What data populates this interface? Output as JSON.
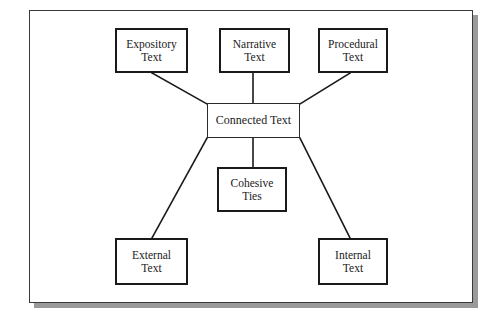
{
  "diagram": {
    "frame": {
      "border_color": "#3a3a3a",
      "background_color": "#ffffff",
      "shadow_color": "#9a9a9a"
    },
    "nodes": [
      {
        "id": "expository-text",
        "label": "Expository\nText",
        "x": 115,
        "y": 28,
        "w": 73,
        "h": 45,
        "font_size": 11.5
      },
      {
        "id": "narrative-text",
        "label": "Narrative\nText",
        "x": 219,
        "y": 28,
        "w": 71,
        "h": 45,
        "font_size": 11.5
      },
      {
        "id": "procedural-text",
        "label": "Procedural\nText",
        "x": 318,
        "y": 28,
        "w": 70,
        "h": 45,
        "font_size": 11.5
      },
      {
        "id": "connected-text",
        "label": "Connected Text",
        "x": 207,
        "y": 103,
        "w": 93,
        "h": 35,
        "font_size": 12
      },
      {
        "id": "cohesive-ties",
        "label": "Cohesive\nTies",
        "x": 217,
        "y": 167,
        "w": 70,
        "h": 45,
        "font_size": 11.5
      },
      {
        "id": "external-text",
        "label": "External\nText",
        "x": 115,
        "y": 238,
        "w": 73,
        "h": 47,
        "font_size": 11.5
      },
      {
        "id": "internal-text",
        "label": "Internal\nText",
        "x": 318,
        "y": 238,
        "w": 70,
        "h": 47,
        "font_size": 11.5
      }
    ],
    "edges": [
      {
        "id": "edge-expository-connected",
        "from": "expository-text",
        "to": "connected-text",
        "x1": 152,
        "y1": 73,
        "x2": 207,
        "y2": 104
      },
      {
        "id": "edge-narrative-connected",
        "from": "narrative-text",
        "to": "connected-text",
        "x1": 253,
        "y1": 73,
        "x2": 253,
        "y2": 103
      },
      {
        "id": "edge-procedural-connected",
        "from": "procedural-text",
        "to": "connected-text",
        "x1": 350,
        "y1": 73,
        "x2": 300,
        "y2": 104
      },
      {
        "id": "edge-connected-cohesive",
        "from": "connected-text",
        "to": "cohesive-ties",
        "x1": 253,
        "y1": 138,
        "x2": 253,
        "y2": 167
      },
      {
        "id": "edge-connected-external",
        "from": "connected-text",
        "to": "external-text",
        "x1": 207,
        "y1": 138,
        "x2": 152,
        "y2": 238
      },
      {
        "id": "edge-connected-internal",
        "from": "connected-text",
        "to": "internal-text",
        "x1": 300,
        "y1": 138,
        "x2": 350,
        "y2": 238
      }
    ],
    "edge_color": "#1a1a1a",
    "edge_width": 1.6
  }
}
